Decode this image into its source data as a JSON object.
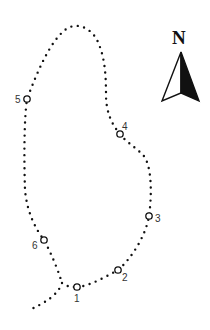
{
  "map": {
    "type": "trail-route-map",
    "trail_color": "#111111",
    "compass": {
      "label": "N",
      "color": "#111111"
    },
    "waypoints": [
      {
        "id": "1",
        "label": "1",
        "x": 77,
        "y": 287,
        "lx": 74,
        "ly": 302
      },
      {
        "id": "2",
        "label": "2",
        "x": 118,
        "y": 270,
        "lx": 122,
        "ly": 281
      },
      {
        "id": "3",
        "label": "3",
        "x": 149,
        "y": 216,
        "lx": 155,
        "ly": 222
      },
      {
        "id": "4",
        "label": "4",
        "x": 120,
        "y": 134,
        "lx": 122,
        "ly": 130
      },
      {
        "id": "5",
        "label": "5",
        "x": 27,
        "y": 99,
        "lx": 15,
        "ly": 103
      },
      {
        "id": "6",
        "label": "6",
        "x": 44,
        "y": 240,
        "lx": 32,
        "ly": 249
      }
    ]
  }
}
